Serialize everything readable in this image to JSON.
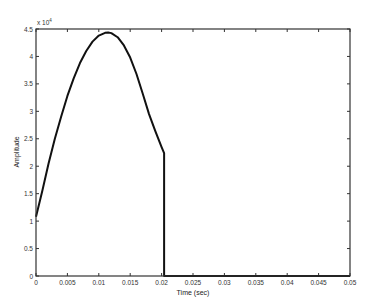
{
  "chart_data": {
    "type": "line",
    "title": "",
    "xlabel": "Time (sec)",
    "ylabel": "Amplitude",
    "y_exponent_label": "x 10",
    "y_exponent": "4",
    "xlim": [
      0,
      0.05
    ],
    "ylim": [
      0,
      45000
    ],
    "grid": false,
    "legend": null,
    "x_ticks": [
      "0",
      "0.005",
      "0.01",
      "0.015",
      "0.02",
      "0.025",
      "0.03",
      "0.035",
      "0.04",
      "0.045",
      "0.05"
    ],
    "x_tick_values": [
      0,
      0.005,
      0.01,
      0.015,
      0.02,
      0.025,
      0.03,
      0.035,
      0.04,
      0.045,
      0.05
    ],
    "y_ticks": [
      "0",
      "0.5",
      "1",
      "1.5",
      "2",
      "2.5",
      "3",
      "3.5",
      "4",
      "4.5"
    ],
    "y_tick_values": [
      0,
      5000,
      10000,
      15000,
      20000,
      25000,
      30000,
      35000,
      40000,
      45000
    ],
    "series": [
      {
        "name": "signal",
        "color": "#111111",
        "x": [
          0,
          0.001,
          0.002,
          0.003,
          0.004,
          0.005,
          0.006,
          0.007,
          0.008,
          0.009,
          0.01,
          0.011,
          0.0115,
          0.012,
          0.013,
          0.014,
          0.015,
          0.016,
          0.017,
          0.018,
          0.019,
          0.02,
          0.0204,
          0.0204,
          0.05
        ],
        "y": [
          10800,
          15500,
          20500,
          25000,
          29000,
          32800,
          36000,
          38800,
          41000,
          42700,
          43800,
          44300,
          44350,
          44250,
          43500,
          42000,
          39800,
          36800,
          33200,
          29500,
          26400,
          23500,
          22400,
          0,
          0
        ]
      }
    ]
  }
}
